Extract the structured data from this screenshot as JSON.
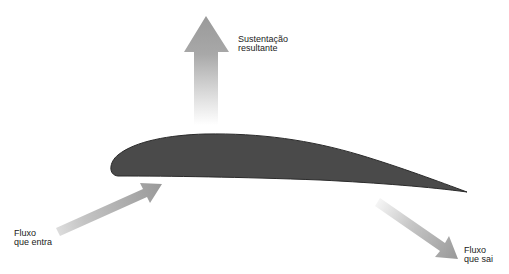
{
  "diagram": {
    "labels": {
      "lift": "Sustentação\nresultante",
      "inflow": "Fluxo\nque entra",
      "outflow": "Fluxo\nque sai"
    },
    "colors": {
      "airfoil": "#4a4a4a",
      "airfoil_outline": "#2a2a2a",
      "arrow": "#9a9a9a",
      "background": "#ffffff"
    },
    "elements": [
      {
        "name": "airfoil",
        "description": "Wing cross-section (airfoil)"
      },
      {
        "name": "lift-arrow",
        "direction": "up"
      },
      {
        "name": "inflow-arrow",
        "direction": "up-right"
      },
      {
        "name": "outflow-arrow",
        "direction": "down-right"
      }
    ]
  }
}
